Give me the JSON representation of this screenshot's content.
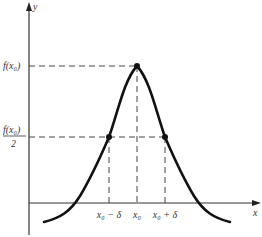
{
  "figure": {
    "axes": {
      "x_label": "x",
      "y_label": "y"
    },
    "y_ticks": [
      {
        "id": "fmax",
        "label_text": "f(x₀)"
      },
      {
        "id": "fhalf",
        "label_num": "f(x₀)",
        "label_den": "2"
      }
    ],
    "x_ticks": [
      {
        "id": "left",
        "label": "x₀ − δ"
      },
      {
        "id": "center",
        "label": "x₀"
      },
      {
        "id": "right",
        "label": "x₀ + δ"
      }
    ],
    "colors": {
      "curve": "#111111",
      "axis": "#333333",
      "dash": "#444444"
    }
  }
}
